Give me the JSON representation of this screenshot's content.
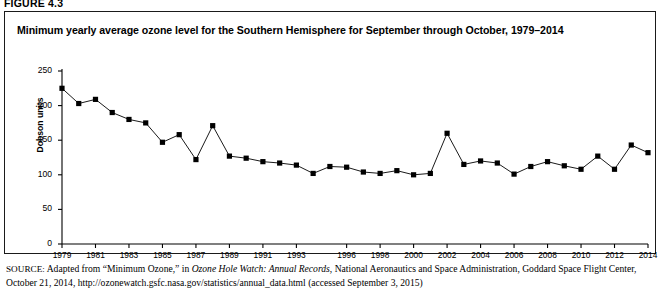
{
  "figure": {
    "label": "FIGURE 4.3",
    "title": "Minimum yearly average ozone level for the Southern Hemisphere for September through October, 1979–2014"
  },
  "source": {
    "prefix": "SOURCE:",
    "text_part1": " Adapted from “Minimum Ozone,” in ",
    "italic_title": "Ozone Hole Watch: Annual Records",
    "text_part2": ", National Aeronautics and Space Administration, Goddard Space Flight Center, October 21, 2014, http://ozonewatch.gsfc.nasa.gov/statistics/annual_data.html (accessed September 3, 2015)"
  },
  "chart_data": {
    "type": "line",
    "title": "Minimum yearly average ozone level for the Southern Hemisphere for September through October, 1979–2014",
    "xlabel": "",
    "ylabel": "Dobson units",
    "ylim": [
      0,
      250
    ],
    "yticks": [
      0,
      50,
      100,
      150,
      200,
      250
    ],
    "ytick_labels": [
      "0",
      "50",
      "100",
      "150",
      "200",
      "250"
    ],
    "xtick_labels": [
      "1979",
      "1981",
      "1983",
      "1985",
      "1987",
      "1989",
      "1991",
      "1993",
      "1996",
      "1998",
      "2000",
      "2002",
      "2004",
      "2006",
      "2008",
      "2010",
      "2012",
      "2014"
    ],
    "grid": false,
    "legend": false,
    "marker": "square",
    "line_color": "#000000",
    "marker_color": "#000000",
    "x": [
      1979,
      1980,
      1981,
      1982,
      1983,
      1984,
      1985,
      1986,
      1987,
      1988,
      1989,
      1990,
      1991,
      1992,
      1993,
      1994,
      1995,
      1996,
      1997,
      1998,
      1999,
      2000,
      2001,
      2002,
      2003,
      2004,
      2005,
      2006,
      2007,
      2008,
      2009,
      2010,
      2011,
      2012,
      2013,
      2014
    ],
    "values": [
      225,
      203,
      209,
      190,
      180,
      175,
      147,
      158,
      122,
      171,
      127,
      124,
      119,
      117,
      114,
      102,
      112,
      111,
      104,
      102,
      106,
      100,
      102,
      160,
      115,
      120,
      117,
      101,
      112,
      119,
      113,
      108,
      127,
      108,
      143,
      132
    ],
    "series": [
      {
        "name": "Minimum ozone",
        "values": [
          225,
          203,
          209,
          190,
          180,
          175,
          147,
          158,
          122,
          171,
          127,
          124,
          119,
          117,
          114,
          102,
          112,
          111,
          104,
          102,
          106,
          100,
          102,
          160,
          115,
          120,
          117,
          101,
          112,
          119,
          113,
          108,
          127,
          108,
          143,
          132
        ]
      }
    ]
  }
}
